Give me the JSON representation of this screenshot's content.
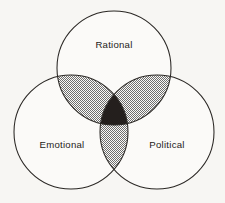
{
  "figure": {
    "type": "venn-diagram-3-set",
    "background_color": "#f7f6f3",
    "outline_color": "#2a2724",
    "pair_overlap_color": "#8c8c8c",
    "triple_overlap_color": "#241f1d",
    "label_color": "#1d1a18"
  },
  "sets": [
    {
      "key": "rational",
      "label": "Rational",
      "position": "top",
      "center_x": 114,
      "center_y": 68,
      "radius": 57,
      "label_x": 114,
      "label_y": 48
    },
    {
      "key": "emotional",
      "label": "Emotional",
      "position": "bottom-left",
      "center_x": 71,
      "center_y": 132,
      "radius": 57,
      "label_x": 62,
      "label_y": 148
    },
    {
      "key": "political",
      "label": "Political",
      "position": "bottom-right",
      "center_x": 157,
      "center_y": 132,
      "radius": 57,
      "label_x": 167,
      "label_y": 148
    }
  ],
  "overlaps": [
    {
      "key": "rational-emotional",
      "shading": "halftone-gray"
    },
    {
      "key": "rational-political",
      "shading": "halftone-gray"
    },
    {
      "key": "emotional-political",
      "shading": "halftone-gray"
    },
    {
      "key": "rational-emotional-political",
      "shading": "solid-dark"
    }
  ]
}
